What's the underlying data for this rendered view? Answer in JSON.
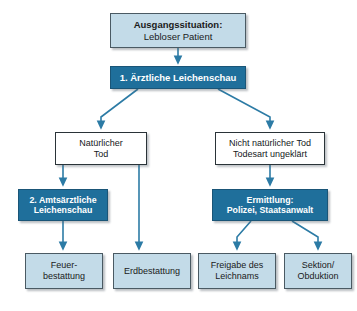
{
  "diagram": {
    "colors": {
      "light_fill": "#c3dbe8",
      "dark_fill": "#1f6f9b",
      "plain_fill": "#ffffff",
      "connector": "#2c7ba5",
      "border_dark": "#2a3338",
      "background": "#ffffff"
    },
    "nodes": {
      "start": {
        "line1": "Ausgangssituation:",
        "line2": "Lebloser Patient"
      },
      "step1": {
        "line1": "1. Ärztliche Leichenschau"
      },
      "natural": {
        "line1": "Natürlicher",
        "line2": "Tod"
      },
      "unnatural": {
        "line1": "Nicht natürlicher Tod",
        "line2": "Todesart ungeklärt"
      },
      "step2": {
        "line1": "2. Amtsärztliche",
        "line2": "Leichenschau"
      },
      "investigation": {
        "line1": "Ermittlung:",
        "line2": "Polizei, Staatsanwalt"
      },
      "cremation": {
        "line1": "Feuer-",
        "line2": "bestattung"
      },
      "burial": {
        "line1": "Erdbestattung"
      },
      "release": {
        "line1": "Freigabe des",
        "line2": "Leichnams"
      },
      "autopsy": {
        "line1": "Sektion/",
        "line2": "Obduktion"
      }
    },
    "caption": ""
  }
}
